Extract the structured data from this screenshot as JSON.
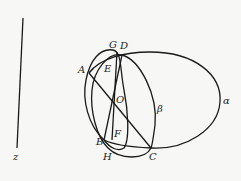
{
  "diagram": {
    "background": "#f7f7f5",
    "stroke_color": "#1a1a1a",
    "points": {
      "A": {
        "label": "A",
        "x": 89,
        "y": 73
      },
      "B": {
        "label": "B",
        "x": 104,
        "y": 140
      },
      "C": {
        "label": "C",
        "x": 151,
        "y": 148
      },
      "D": {
        "label": "D",
        "x": 122,
        "y": 55
      },
      "E": {
        "label": "E",
        "x": 106,
        "y": 71
      },
      "F": {
        "label": "F",
        "x": 115,
        "y": 133
      },
      "G": {
        "label": "G",
        "x": 113,
        "y": 45
      },
      "H": {
        "label": "H",
        "x": 106,
        "y": 156
      },
      "O": {
        "label": "O",
        "x": 120,
        "y": 98
      }
    },
    "labels": {
      "A": "A",
      "B": "B",
      "C": "C",
      "D": "D",
      "E": "E",
      "F": "F",
      "G": "G",
      "H": "H",
      "O": "O",
      "alpha": "α",
      "beta": "β",
      "z": "z"
    },
    "curves": [
      {
        "name": "great-circle-alpha",
        "label": "α"
      },
      {
        "name": "great-circle-beta",
        "label": "β"
      },
      {
        "name": "circle-through-A-B",
        "label": ""
      }
    ],
    "segments": [
      "AC",
      "DB",
      "GF-line",
      "axis-z"
    ]
  }
}
